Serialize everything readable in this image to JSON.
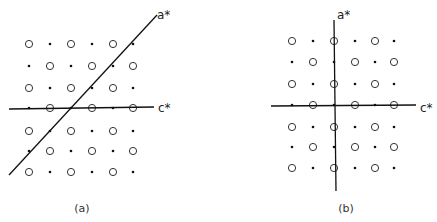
{
  "panels": [
    {
      "id": "a",
      "caption": "(a)",
      "axis_labels": {
        "vertical": "a*",
        "horizontal": "c*"
      },
      "columns_x": [
        29,
        50,
        71,
        92,
        113,
        133
      ],
      "rows_y": [
        44,
        66,
        88,
        108,
        131,
        151,
        172
      ],
      "pattern": [
        [
          "O",
          "D",
          "O",
          "D",
          "O",
          "D"
        ],
        [
          "D",
          "O",
          "D",
          "O",
          "D",
          "O"
        ],
        [
          "O",
          "D",
          "O",
          "D",
          "O",
          "D"
        ],
        [
          "D",
          "O",
          "D",
          "O",
          "D",
          "O"
        ],
        [
          "O",
          "D",
          "O",
          "D",
          "O",
          "D"
        ],
        [
          "D",
          "O",
          "D",
          "O",
          "D",
          "O"
        ],
        [
          "O",
          "D",
          "O",
          "D",
          "O",
          "D"
        ]
      ],
      "horizontal_axis": {
        "x1": 9,
        "y1": 109,
        "x2": 154,
        "y2": 107
      },
      "astar_axis": {
        "x1": 9,
        "y1": 175,
        "x2": 157,
        "y2": 15
      },
      "astar_label_pos": [
        157,
        19
      ],
      "cstar_label_pos": [
        158,
        112
      ],
      "caption_pos": [
        82,
        212
      ]
    },
    {
      "id": "b",
      "caption": "(b)",
      "axis_labels": {
        "vertical": "a*",
        "horizontal": "c*"
      },
      "columns_x": [
        292,
        313,
        334,
        355,
        375,
        394
      ],
      "rows_y": [
        41,
        62,
        84,
        105,
        127,
        147,
        168
      ],
      "pattern": [
        [
          "O",
          "D",
          "O",
          "D",
          "O",
          "D"
        ],
        [
          "D",
          "O",
          "D",
          "O",
          "D",
          "O"
        ],
        [
          "O",
          "D",
          "O",
          "D",
          "O",
          "D"
        ],
        [
          "D",
          "O",
          "D",
          "O",
          "D",
          "O"
        ],
        [
          "O",
          "D",
          "O",
          "D",
          "O",
          "D"
        ],
        [
          "D",
          "O",
          "D",
          "O",
          "D",
          "O"
        ],
        [
          "O",
          "D",
          "O",
          "D",
          "O",
          "D"
        ]
      ],
      "horizontal_axis": {
        "x1": 271,
        "y1": 106,
        "x2": 416,
        "y2": 105
      },
      "astar_axis": {
        "x1": 334,
        "y1": 20,
        "x2": 336,
        "y2": 191
      },
      "astar_label_pos": [
        337,
        19
      ],
      "cstar_label_pos": [
        420,
        112
      ],
      "caption_pos": [
        346,
        212
      ]
    }
  ]
}
